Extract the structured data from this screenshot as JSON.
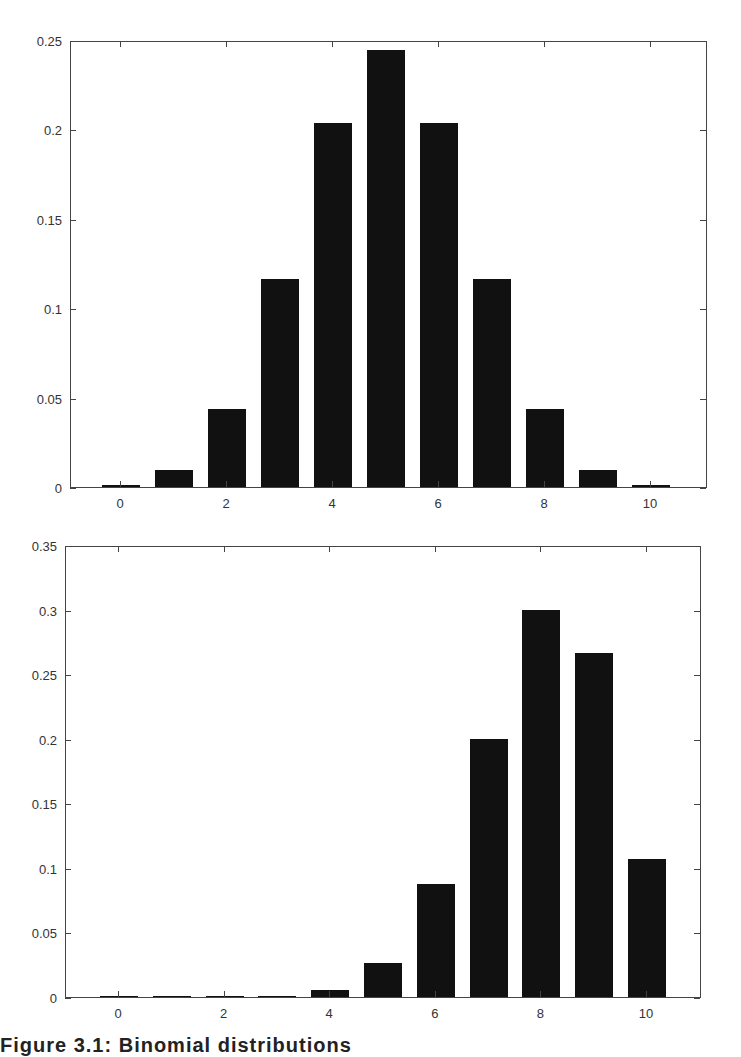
{
  "figure": {
    "caption": "Figure 3.1: Binomial distributions"
  },
  "chart_data": [
    {
      "type": "bar",
      "title": "",
      "xlabel": "",
      "ylabel": "",
      "categories": [
        0,
        1,
        2,
        3,
        4,
        5,
        6,
        7,
        8,
        9,
        10
      ],
      "values": [
        0.001,
        0.0098,
        0.0439,
        0.1172,
        0.2051,
        0.2461,
        0.2051,
        0.1172,
        0.0439,
        0.0098,
        0.001
      ],
      "ylim": [
        0,
        0.25
      ],
      "xlim": [
        -1,
        11
      ],
      "yticks": [
        "0",
        "0.05",
        "0.1",
        "0.15",
        "0.2",
        "0.25"
      ],
      "xticks": [
        "0",
        "2",
        "4",
        "6",
        "8",
        "10"
      ],
      "grid": false,
      "legend": null,
      "bar_color": "#111111"
    },
    {
      "type": "bar",
      "title": "",
      "xlabel": "",
      "ylabel": "",
      "categories": [
        0,
        1,
        2,
        3,
        4,
        5,
        6,
        7,
        8,
        9,
        10
      ],
      "values": [
        0.0,
        0.0,
        0.0001,
        0.0008,
        0.0055,
        0.0264,
        0.0881,
        0.2013,
        0.302,
        0.2684,
        0.1074
      ],
      "ylim": [
        0,
        0.35
      ],
      "xlim": [
        -1,
        11
      ],
      "yticks": [
        "0",
        "0.05",
        "0.1",
        "0.15",
        "0.2",
        "0.25",
        "0.3",
        "0.35"
      ],
      "xticks": [
        "0",
        "2",
        "4",
        "6",
        "8",
        "10"
      ],
      "grid": false,
      "legend": null,
      "bar_color": "#111111"
    }
  ]
}
